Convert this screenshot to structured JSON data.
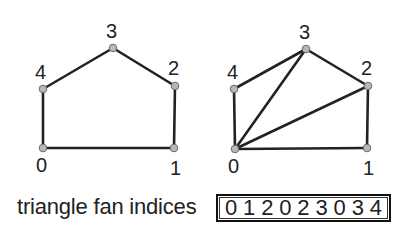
{
  "diagrams": [
    {
      "name": "polygon",
      "vertices": [
        {
          "id": "0",
          "x": 43,
          "y": 148,
          "label_x": 36,
          "label_y": 172
        },
        {
          "id": "1",
          "x": 174,
          "y": 148,
          "label_x": 170,
          "label_y": 175
        },
        {
          "id": "2",
          "x": 175,
          "y": 86,
          "label_x": 168,
          "label_y": 75
        },
        {
          "id": "3",
          "x": 113,
          "y": 48,
          "label_x": 106,
          "label_y": 38
        },
        {
          "id": "4",
          "x": 43,
          "y": 89,
          "label_x": 35,
          "label_y": 79
        }
      ],
      "edges": [
        [
          0,
          1
        ],
        [
          1,
          2
        ],
        [
          2,
          3
        ],
        [
          3,
          4
        ],
        [
          4,
          0
        ]
      ]
    },
    {
      "name": "triangle-fan",
      "vertices": [
        {
          "id": "0",
          "x": 235,
          "y": 149,
          "label_x": 228,
          "label_y": 173
        },
        {
          "id": "1",
          "x": 367,
          "y": 148,
          "label_x": 363,
          "label_y": 175
        },
        {
          "id": "2",
          "x": 368,
          "y": 86,
          "label_x": 361,
          "label_y": 75
        },
        {
          "id": "3",
          "x": 306,
          "y": 49,
          "label_x": 299,
          "label_y": 39
        },
        {
          "id": "4",
          "x": 234,
          "y": 89,
          "label_x": 227,
          "label_y": 79
        }
      ],
      "edges": [
        [
          0,
          1
        ],
        [
          1,
          2
        ],
        [
          2,
          3
        ],
        [
          3,
          4
        ],
        [
          4,
          0
        ],
        [
          0,
          2
        ],
        [
          0,
          3
        ]
      ]
    }
  ],
  "caption": {
    "label": "triangle fan indices",
    "indices": [
      "0",
      "1",
      "2",
      "0",
      "2",
      "3",
      "0",
      "3",
      "4"
    ]
  },
  "colors": {
    "stroke": "#222222",
    "vertex_fill": "#b8b8b8",
    "vertex_stroke": "#6a6a6a",
    "text": "#222222"
  }
}
